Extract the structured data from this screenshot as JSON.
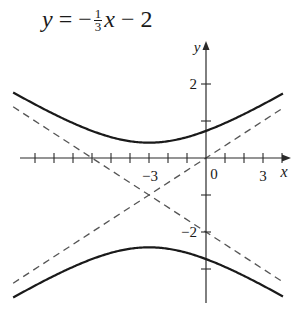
{
  "equation_label": {
    "lhs": "y",
    "equals": "=",
    "sign": "−",
    "frac_num": "1",
    "frac_den": "3",
    "var": "x",
    "rest": "− 2"
  },
  "axes": {
    "x_label": "x",
    "y_label": "y",
    "x_tick_labels": [
      {
        "value": -3,
        "text": "−3"
      },
      {
        "value": 0,
        "text": "0"
      },
      {
        "value": 3,
        "text": "3"
      }
    ],
    "y_tick_labels": [
      {
        "value": 2,
        "text": "2"
      },
      {
        "value": -2,
        "text": "−2"
      }
    ],
    "x_ticks": [
      -9,
      -8,
      -7,
      -6,
      -5,
      -4,
      -3,
      -2,
      -1,
      1,
      2,
      3,
      4
    ],
    "y_ticks": [
      -3,
      -2,
      -1,
      1,
      2
    ],
    "x_range": [
      -10,
      4.5
    ],
    "y_range": [
      -3.9,
      3.1
    ]
  },
  "curves": {
    "hyperbola": {
      "equation": "(y+1)^2/2 - (x+3)^2/18 = 1",
      "center": [
        -3,
        -1
      ],
      "style": "solid",
      "color": "#1a1a1a"
    },
    "asymptotes": [
      {
        "equation": "y = (1/3)x",
        "style": "dashed",
        "color": "#555555"
      },
      {
        "equation": "y = -(1/3)x - 2",
        "style": "dashed",
        "color": "#555555"
      }
    ]
  },
  "colors": {
    "axis": "#2a2a2a",
    "curve": "#1a1a1a",
    "dashed": "#555555",
    "background": "#ffffff"
  }
}
